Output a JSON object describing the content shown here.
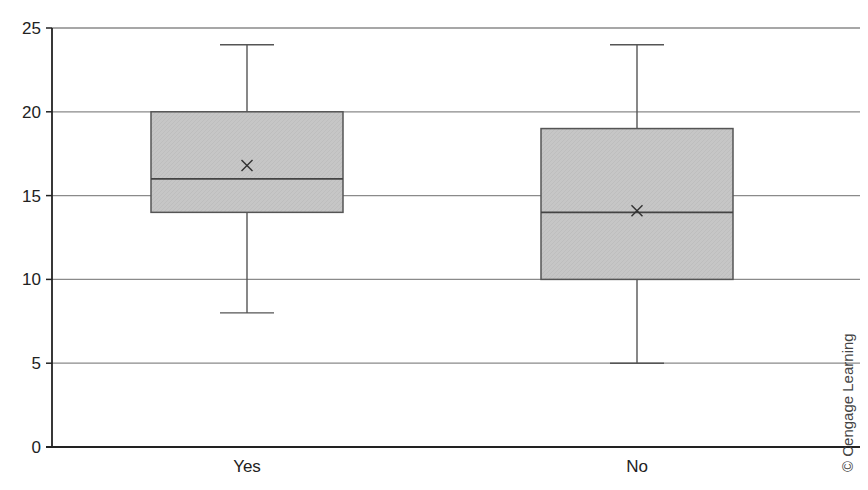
{
  "chart_data": {
    "type": "boxplot",
    "title": "",
    "xlabel": "",
    "ylabel": "",
    "categories": [
      "Yes",
      "No"
    ],
    "ylim": [
      0,
      25
    ],
    "yticks": [
      0,
      5,
      10,
      15,
      20,
      25
    ],
    "grid": {
      "horizontal": true,
      "vertical": false
    },
    "legend": null,
    "series": [
      {
        "name": "Yes",
        "min": 8,
        "q1": 14,
        "median": 16,
        "q3": 20,
        "max": 24,
        "mean": 16.8
      },
      {
        "name": "No",
        "min": 5,
        "q1": 10,
        "median": 14,
        "q3": 19,
        "max": 24,
        "mean": 14.1
      }
    ],
    "colors": {
      "box_fill": "#c8c8c8",
      "box_stroke": "#555555",
      "gridline": "#8a8a8a",
      "axis": "#222222",
      "mean_marker": "#333333"
    },
    "annotations": [
      "© Cengage Learning"
    ]
  },
  "credit": {
    "text": "© Cengage Learning"
  }
}
